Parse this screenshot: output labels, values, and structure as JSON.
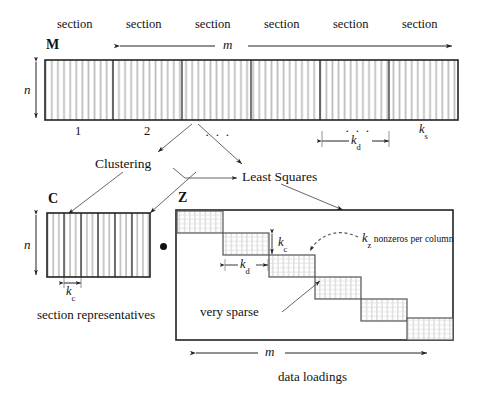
{
  "figure": {
    "title_caption_bottom": "data loadings",
    "caption_c": "section representatives"
  },
  "matrix_m": {
    "name": "M",
    "row_label": "n",
    "width_label": "m",
    "section_labels": [
      "section",
      "section",
      "section",
      "section",
      "section",
      "section"
    ],
    "column_numbers": [
      "1",
      "2"
    ],
    "ellipsis": "· · ·",
    "ellipsis_right": "· · ·",
    "kd_label": "k",
    "kd_sub": "d",
    "ks_label": "k",
    "ks_sub": "s",
    "box": {
      "x": 45,
      "y": 60,
      "w": 413,
      "h": 60
    },
    "dividers": [
      113,
      182,
      251,
      320,
      389
    ],
    "stripes_per_section": 12
  },
  "matrix_c": {
    "name": "C",
    "row_label": "n",
    "kc_label": "k",
    "kc_sub": "c",
    "box": {
      "x": 47,
      "y": 213,
      "w": 103,
      "h": 64
    },
    "dividers": [
      64,
      81,
      98,
      115,
      132
    ],
    "stripes_per_section": 3
  },
  "matrix_z": {
    "name": "Z",
    "width_label": "m",
    "kc_label": "k",
    "kc_sub": "c",
    "kd_label": "k",
    "kd_sub": "d",
    "kz_label": "k",
    "kz_sub": "z",
    "kz_note": "nonzeros per column",
    "sparse_label": "very sparse",
    "box": {
      "x": 176,
      "y": 210,
      "w": 277,
      "h": 130
    },
    "blocks": [
      {
        "x": 177,
        "y": 211,
        "w": 46,
        "h": 22
      },
      {
        "x": 223,
        "y": 233,
        "w": 46,
        "h": 22
      },
      {
        "x": 269,
        "y": 255,
        "w": 46,
        "h": 22
      },
      {
        "x": 315,
        "y": 277,
        "w": 46,
        "h": 22
      },
      {
        "x": 361,
        "y": 299,
        "w": 46,
        "h": 22
      },
      {
        "x": 407,
        "y": 318,
        "w": 46,
        "h": 22
      }
    ]
  },
  "operations": {
    "clustering": "Clustering",
    "least_squares": "Least Squares",
    "multiply_dot": "•"
  },
  "colors": {
    "line": "#222222",
    "stripe": "#b9b9b9",
    "hatch": "#c9c9c9",
    "text": "#111111",
    "thin": "#555555"
  }
}
